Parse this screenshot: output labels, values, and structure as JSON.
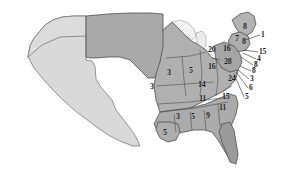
{
  "map": {
    "title": "United States electoral vote map",
    "colors": {
      "background": "#ffffff",
      "region_west_light": "#d9d9d9",
      "region_plains_dark": "#a9a9a9",
      "region_state_mid": "#b0b0b0",
      "region_state_dark": "#9a9a9a",
      "border": "#555555",
      "label_text": "#1a1a1a",
      "leader_line": "#2b2b2b"
    },
    "legend_note": ""
  },
  "chart_data": {
    "type": "map",
    "value_label": "Electoral votes",
    "states": [
      {
        "name": "Kansas",
        "value": "3",
        "x": 171,
        "y": 73,
        "shade": "mid"
      },
      {
        "name": "Missouri",
        "value": "5",
        "x": 193,
        "y": 71,
        "shade": "mid"
      },
      {
        "name": "Illinois",
        "value": "16",
        "x": 212,
        "y": 67,
        "shade": "mid"
      },
      {
        "name": "Ohio",
        "value": "24",
        "x": 232,
        "y": 79,
        "shade": "mid"
      },
      {
        "name": "Pennsylvania",
        "value": "28",
        "x": 228,
        "y": 62,
        "shade": "mid"
      },
      {
        "name": "New York",
        "value": "20",
        "x": 212,
        "y": 50,
        "shade": "mid"
      },
      {
        "name": "Michigan",
        "value": "16",
        "x": 227,
        "y": 49,
        "shade": "mid"
      },
      {
        "name": "Oklahoma",
        "value": "3",
        "x": 154,
        "y": 87,
        "shade": "mid"
      },
      {
        "name": "Kentucky",
        "value": "14",
        "x": 202,
        "y": 85,
        "shade": "mid"
      },
      {
        "name": "Tennessee",
        "value": "11",
        "x": 203,
        "y": 99,
        "shade": "mid"
      },
      {
        "name": "North Carolina",
        "value": "15",
        "x": 226,
        "y": 97,
        "shade": "mid"
      },
      {
        "name": "South Carolina",
        "value": "11",
        "x": 223,
        "y": 108,
        "shade": "mid"
      },
      {
        "name": "Arkansas",
        "value": "3",
        "x": 180,
        "y": 117,
        "shade": "mid"
      },
      {
        "name": "Mississippi",
        "value": "5",
        "x": 195,
        "y": 117,
        "shade": "mid"
      },
      {
        "name": "Alabama",
        "value": "9",
        "x": 210,
        "y": 116,
        "shade": "mid"
      },
      {
        "name": "Louisiana",
        "value": "5",
        "x": 167,
        "y": 133,
        "shade": "mid"
      },
      {
        "name": "Maine",
        "value": "8",
        "x": 247,
        "y": 27,
        "shade": "mid"
      },
      {
        "name": "New Hampshire",
        "value": "7",
        "x": 239,
        "y": 39,
        "shade": "mid"
      },
      {
        "name": "Vermont",
        "value": "8",
        "x": 246,
        "y": 42,
        "shade": "mid"
      }
    ],
    "callouts": [
      {
        "name": "Massachusetts",
        "value": "1",
        "x": 263,
        "y": 35,
        "tx": 245,
        "ty": 40
      },
      {
        "name": "Rhode Island",
        "value": "15",
        "x": 261,
        "y": 52,
        "tx": 244,
        "ty": 50
      },
      {
        "name": "Connecticut",
        "value": "4",
        "x": 259,
        "y": 59,
        "tx": 243,
        "ty": 53
      },
      {
        "name": "New Jersey",
        "value": "8",
        "x": 256,
        "y": 65,
        "tx": 241,
        "ty": 57
      },
      {
        "name": "Delaware",
        "value": "8",
        "x": 254,
        "y": 71,
        "tx": 240,
        "ty": 66
      },
      {
        "name": "Maryland",
        "value": "3",
        "x": 252,
        "y": 79,
        "tx": 238,
        "ty": 70
      },
      {
        "name": "Virginia",
        "value": "6",
        "x": 251,
        "y": 88,
        "tx": 236,
        "ty": 72
      },
      {
        "name": "West Virginia",
        "value": "5",
        "x": 247,
        "y": 97,
        "tx": 234,
        "ty": 74
      }
    ]
  }
}
